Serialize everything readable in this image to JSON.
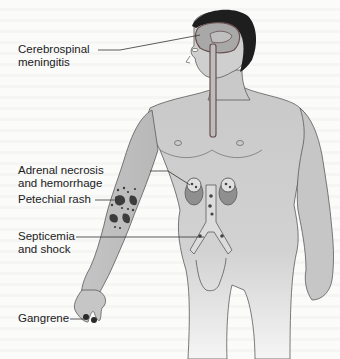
{
  "figure": {
    "colors": {
      "skin": "#c9c9c9",
      "skin_shadow": "#b0b0b0",
      "outline": "#5a5a5a",
      "hair": "#1e1e1e",
      "vessels": "#7a5a5a",
      "lesions": "#3c3c3c",
      "label_text": "#1a1a1a"
    }
  },
  "labels": [
    {
      "id": "cerebrospinal-meningitis",
      "line1": "Cerebrospinal",
      "line2": "meningitis"
    },
    {
      "id": "adrenal-necrosis",
      "line1": "Adrenal necrosis",
      "line2": "and hemorrhage"
    },
    {
      "id": "petechial-rash",
      "line1": "Petechial rash"
    },
    {
      "id": "septicemia-shock",
      "line1": "Septicemia",
      "line2": "and shock"
    },
    {
      "id": "gangrene",
      "line1": "Gangrene"
    }
  ]
}
